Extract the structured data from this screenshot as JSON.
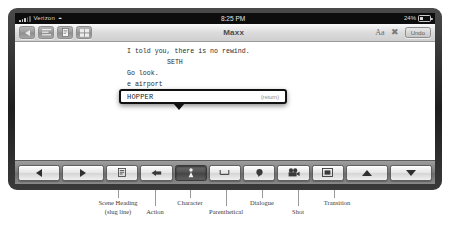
{
  "status_bar": {
    "carrier": "Verizon",
    "signal_icon": "signal-bars-icon",
    "wifi_icon": "wifi-icon",
    "time": "8:25 PM",
    "battery_percent": "24%",
    "battery_icon": "battery-icon"
  },
  "toolbar": {
    "back_icon": "back-arrow-icon",
    "list_icon": "list-icon",
    "page_icon": "document-page-icon",
    "grid_icon": "grid-icon",
    "title": "Maxx",
    "font_size_label": "Aa",
    "close_icon": "close-x-icon",
    "undo_label": "Undo"
  },
  "script": {
    "lines": [
      {
        "text": "I told you, there is no rewind.",
        "type": "action"
      },
      {
        "text": "SETH",
        "type": "character"
      },
      {
        "text": "Go look.",
        "type": "dialogue"
      },
      {
        "text": "e airport",
        "type": "behind"
      },
      {
        "text": "HOP",
        "type": "typing"
      }
    ]
  },
  "autocomplete": {
    "suggestion": "HOPPER",
    "hint": "(return)"
  },
  "format_bar": {
    "prev_icon": "left-triangle-icon",
    "next_icon": "right-triangle-icon",
    "buttons": [
      {
        "name": "scene-heading",
        "icon": "scene-heading-icon",
        "selected": false
      },
      {
        "name": "action",
        "icon": "action-icon",
        "selected": false
      },
      {
        "name": "character",
        "icon": "character-person-icon",
        "selected": true
      },
      {
        "name": "parenthetical",
        "icon": "parenthetical-icon",
        "selected": false
      },
      {
        "name": "dialogue",
        "icon": "dialogue-dot-icon",
        "selected": false
      },
      {
        "name": "shot",
        "icon": "shot-camera-icon",
        "selected": false
      },
      {
        "name": "transition",
        "icon": "transition-box-icon",
        "selected": false
      }
    ],
    "up_icon": "up-triangle-icon",
    "down_icon": "down-triangle-icon"
  },
  "annotations": [
    {
      "line1": "Scene Heading",
      "line2": "(slug line)"
    },
    {
      "line1": "Action",
      "line2": ""
    },
    {
      "line1": "Character",
      "line2": ""
    },
    {
      "line1": "Parenthetical",
      "line2": ""
    },
    {
      "line1": "Dialogue",
      "line2": ""
    },
    {
      "line1": "Shot",
      "line2": ""
    },
    {
      "line1": "Transition",
      "line2": ""
    }
  ]
}
